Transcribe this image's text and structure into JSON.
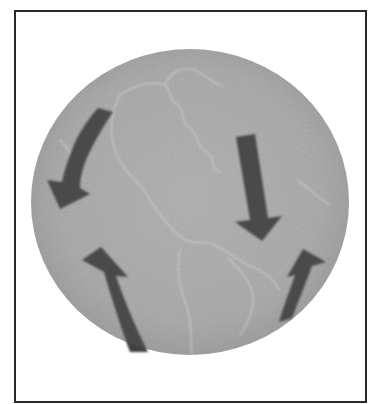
{
  "figure": {
    "frame": {
      "x": 14,
      "y": 10,
      "width": 351,
      "height": 391,
      "stroke": "#2a2a2a"
    },
    "globe": {
      "cx": 190,
      "cy": 202,
      "rx": 159,
      "ry": 153,
      "fill": "#bdbdbd",
      "edge_shade": "#a9a9a9",
      "coastline_color": "#e6e6e6"
    },
    "arrows": [
      {
        "id": "top-left",
        "direction": "down-left (curved)",
        "color": "#3f3f3f"
      },
      {
        "id": "top-right",
        "direction": "down",
        "color": "#3f3f3f"
      },
      {
        "id": "bottom-left",
        "direction": "up",
        "color": "#3f3f3f"
      },
      {
        "id": "bottom-right",
        "direction": "up (curved)",
        "color": "#3f3f3f"
      }
    ]
  }
}
